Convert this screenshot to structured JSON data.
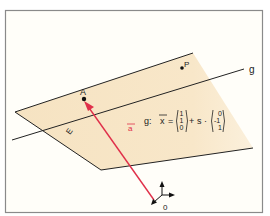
{
  "figure": {
    "background": "#fffef8",
    "frame_color": "#8a8a8a",
    "plane_color": "#f7e6c6",
    "line_color": "#222222",
    "vector_color": "#e0304a",
    "labels": {
      "plane": "E",
      "line": "g",
      "point_a": "A",
      "point_p": "P",
      "origin": "0",
      "vector": "a"
    },
    "equation": {
      "prefix": "g:",
      "variable": "x",
      "equals": "=",
      "support_vector": [
        "1",
        "1",
        "0"
      ],
      "plus": "+",
      "parameter": "s",
      "dot": "·",
      "direction_vector": [
        "0",
        "-1",
        "1"
      ]
    }
  }
}
